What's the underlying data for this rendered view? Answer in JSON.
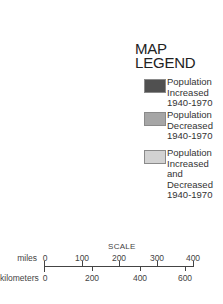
{
  "legend": {
    "title_line1": "MAP",
    "title_line2": "LEGEND",
    "items": [
      {
        "label": "Population\nIncreased\n1940-1970",
        "color": "#505050"
      },
      {
        "label": "Population\nDecreased\n1940-1970",
        "color": "#a6a6a6"
      },
      {
        "label": "Population\nIncreased\nand\nDecreased\n1940-1970",
        "color": "#d2d2d2"
      }
    ]
  },
  "scale": {
    "title": "SCALE",
    "miles": {
      "unit": "miles",
      "ticks": [
        "0",
        "100",
        "200",
        "300",
        "400"
      ]
    },
    "kilometers": {
      "unit": "kilometers",
      "ticks": [
        "0",
        "200",
        "400",
        "600"
      ]
    }
  }
}
